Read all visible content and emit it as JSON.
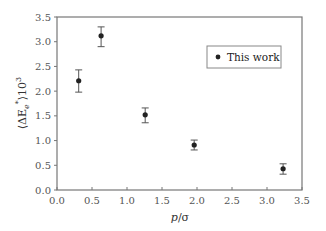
{
  "chart_data": {
    "type": "scatter",
    "title": "",
    "xlabel": "p/σ",
    "xlabel_parts": {
      "italic": "p",
      "rest": "/σ"
    },
    "ylabel": "⟨ΔE_e*⟩10^3",
    "ylabel_parts": {
      "open": "⟨ΔE",
      "sub": "e",
      "sup": "*",
      "close": "⟩10",
      "exp": "3"
    },
    "xlim": [
      0.0,
      3.5
    ],
    "ylim": [
      0.0,
      3.5
    ],
    "xticks": [
      "0.0",
      "0.5",
      "1.0",
      "1.5",
      "2.0",
      "2.5",
      "3.0",
      "3.5"
    ],
    "yticks": [
      "0.0",
      "0.5",
      "1.0",
      "1.5",
      "2.0",
      "2.5",
      "3.0",
      "3.5"
    ],
    "grid": false,
    "legend_position": "upper right",
    "series": [
      {
        "name": "This work",
        "marker": "circle",
        "color": "#222222",
        "x": [
          0.31,
          0.63,
          1.26,
          1.96,
          3.23
        ],
        "y": [
          2.21,
          3.12,
          1.52,
          0.91,
          0.43
        ],
        "y_err_low": [
          1.98,
          2.9,
          1.36,
          0.81,
          0.32
        ],
        "y_err_high": [
          2.43,
          3.3,
          1.66,
          1.01,
          0.53
        ]
      }
    ]
  },
  "legend": {
    "label": "This work"
  },
  "colors": {
    "axis": "#777777",
    "marker": "#222222",
    "errorbar": "#555555"
  }
}
